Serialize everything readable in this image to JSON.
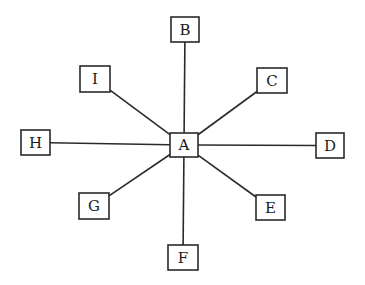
{
  "diagram": {
    "type": "star",
    "center": "A",
    "stroke_color": "#2a2a2a",
    "background": "#ffffff",
    "nodes": [
      {
        "id": "A",
        "label": "A",
        "x": 170,
        "y": 133,
        "w": 28,
        "h": 24
      },
      {
        "id": "B",
        "label": "B",
        "x": 171,
        "y": 17,
        "w": 28,
        "h": 25
      },
      {
        "id": "C",
        "label": "C",
        "x": 257,
        "y": 68,
        "w": 30,
        "h": 25
      },
      {
        "id": "D",
        "label": "D",
        "x": 316,
        "y": 133,
        "w": 28,
        "h": 25
      },
      {
        "id": "E",
        "label": "E",
        "x": 256,
        "y": 195,
        "w": 29,
        "h": 25
      },
      {
        "id": "F",
        "label": "F",
        "x": 168,
        "y": 245,
        "w": 30,
        "h": 25
      },
      {
        "id": "G",
        "label": "G",
        "x": 79,
        "y": 193,
        "w": 30,
        "h": 26
      },
      {
        "id": "H",
        "label": "H",
        "x": 21,
        "y": 130,
        "w": 29,
        "h": 25
      },
      {
        "id": "I",
        "label": "I",
        "x": 80,
        "y": 66,
        "w": 30,
        "h": 26
      }
    ],
    "edges": [
      {
        "from": "A",
        "to": "B"
      },
      {
        "from": "A",
        "to": "C"
      },
      {
        "from": "A",
        "to": "D"
      },
      {
        "from": "A",
        "to": "E"
      },
      {
        "from": "A",
        "to": "F"
      },
      {
        "from": "A",
        "to": "G"
      },
      {
        "from": "A",
        "to": "H"
      },
      {
        "from": "A",
        "to": "I"
      }
    ]
  }
}
